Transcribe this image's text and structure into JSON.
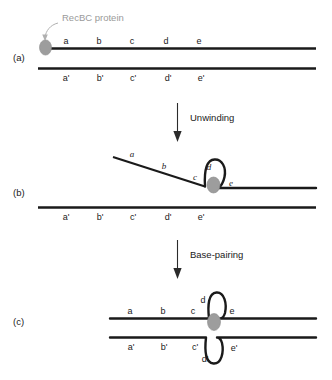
{
  "figure": {
    "background_color": "#ffffff",
    "strand_color": "#1a1a1a",
    "protein_color": "#9d9d9d",
    "callout_color": "#9a9a9a"
  },
  "callout": {
    "label": "RecBC protein",
    "icon": "arrow-up-left-icon"
  },
  "panels": [
    {
      "id": "a",
      "label": "(a)",
      "top_strand_labels": [
        "a",
        "b",
        "c",
        "d",
        "e"
      ],
      "bottom_strand_labels": [
        "a'",
        "b'",
        "c'",
        "d'",
        "e'"
      ]
    },
    {
      "id": "b",
      "label": "(b)",
      "top_strand_labels": [
        "a",
        "b",
        "c",
        "d",
        "e"
      ],
      "bottom_strand_labels": [
        "a'",
        "b'",
        "c'",
        "d'",
        "e'"
      ]
    },
    {
      "id": "c",
      "label": "(c)",
      "top_strand_labels": [
        "a",
        "b",
        "c",
        "d",
        "e"
      ],
      "bottom_strand_labels": [
        "a'",
        "b'",
        "c'",
        "d'",
        "e'"
      ]
    }
  ],
  "steps": [
    {
      "id": "unwinding",
      "label": "Unwinding",
      "icon": "arrow-down-icon"
    },
    {
      "id": "base-pairing",
      "label": "Base-pairing",
      "icon": "arrow-down-icon"
    }
  ]
}
